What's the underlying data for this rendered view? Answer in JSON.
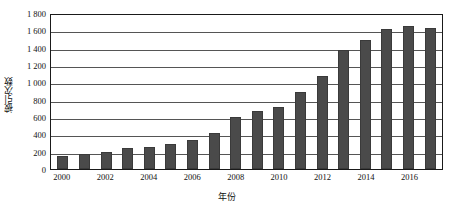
{
  "chart_data": {
    "type": "bar",
    "title": "",
    "xlabel": "年份",
    "ylabel": "被引次数",
    "categories": [
      "2000",
      "2001",
      "2002",
      "2003",
      "2004",
      "2005",
      "2006",
      "2007",
      "2008",
      "2009",
      "2010",
      "2011",
      "2012",
      "2013",
      "2014",
      "2015",
      "2016",
      "2017"
    ],
    "values": [
      150,
      170,
      195,
      240,
      255,
      285,
      340,
      410,
      595,
      670,
      715,
      890,
      1075,
      1370,
      1485,
      1620,
      1655,
      1625
    ],
    "ylim": [
      0,
      1800
    ],
    "ytick_values": [
      0,
      200,
      400,
      600,
      800,
      1000,
      1200,
      1400,
      1600,
      1800
    ],
    "ytick_labels": [
      "0",
      "200",
      "400",
      "600",
      "800",
      "1 000",
      "1 200",
      "1 400",
      "1 600",
      "1 800"
    ],
    "xtick_labels": [
      "2000",
      "2002",
      "2004",
      "2006",
      "2008",
      "2010",
      "2012",
      "2014",
      "2016"
    ],
    "xtick_categories": [
      "2000",
      "2002",
      "2004",
      "2006",
      "2008",
      "2010",
      "2012",
      "2014",
      "2016"
    ],
    "grid": "horizontal",
    "legend": "none",
    "bar_color": "#4a4a4a",
    "bar_edge_color": "#3a3a3a",
    "axis_color": "#1a1a1a",
    "grid_color": "#555555"
  }
}
